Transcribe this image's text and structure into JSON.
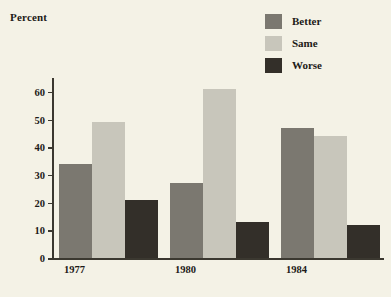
{
  "chart_data": {
    "type": "bar",
    "title": "",
    "ylabel": "Percent",
    "xlabel": "",
    "categories": [
      "1977",
      "1980",
      "1984"
    ],
    "series": [
      {
        "name": "Better",
        "color": "#7b7870",
        "values": [
          34,
          27,
          47
        ]
      },
      {
        "name": "Same",
        "color": "#c8c6bb",
        "values": [
          49,
          61,
          44
        ]
      },
      {
        "name": "Worse",
        "color": "#332f29",
        "values": [
          21,
          13,
          12
        ]
      }
    ],
    "ylim": [
      0,
      65
    ],
    "yticks": [
      0,
      10,
      20,
      30,
      40,
      50,
      60
    ],
    "ytick_labels": [
      "0",
      "10",
      "20",
      "30",
      "40",
      "50",
      "60"
    ],
    "grid": false,
    "legend_position": "top-right"
  },
  "legend": {
    "items": [
      {
        "label": "Better",
        "color": "#7b7870"
      },
      {
        "label": "Same",
        "color": "#c8c6bb"
      },
      {
        "label": "Worse",
        "color": "#332f29"
      }
    ]
  },
  "colors": {
    "background": "#f4f2e6",
    "axis": "#3b3830",
    "text": "#1d1b18",
    "better": "#7b7870",
    "same": "#c8c6bb",
    "worse": "#332f29"
  }
}
